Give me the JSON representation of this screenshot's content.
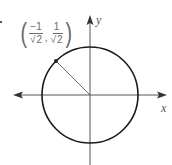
{
  "diagram": {
    "type": "unit-circle",
    "axes": {
      "x_label": "x",
      "y_label": "y",
      "x_arrows": "both",
      "y_arrows": "up"
    },
    "circle": {
      "center": [
        90,
        95
      ],
      "radius": 48,
      "stroke": "#1a1a1a"
    },
    "point": {
      "label": {
        "x_num": "−1",
        "x_den_root": "2",
        "y_num": "1",
        "y_den_root": "2",
        "open": "(",
        "close": ")",
        "separator": ",",
        "radical": "√"
      },
      "coords_exact": "(-1/√2, 1/√2)",
      "angle_deg": 135
    },
    "colors": {
      "axis": "#555555",
      "circle": "#1a1a1a",
      "radius_line": "#666666",
      "label_text": "#6a6a6a"
    }
  }
}
